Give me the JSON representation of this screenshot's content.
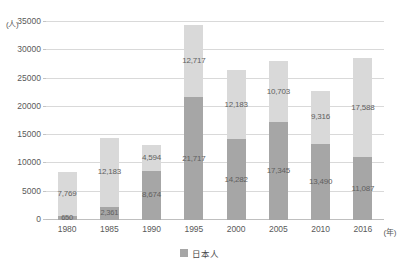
{
  "chart_data": {
    "type": "bar",
    "stacked": true,
    "title": "",
    "xlabel": "(年)",
    "ylabel": "(人)",
    "ylim": [
      0,
      35000
    ],
    "ystep": 5000,
    "grid": true,
    "legend_position": "bottom-center",
    "categories": [
      "1980",
      "1985",
      "1990",
      "1995",
      "2000",
      "2005",
      "2010",
      "2016"
    ],
    "yticks": [
      "0",
      "5000",
      "10000",
      "15000",
      "20000",
      "25000",
      "30000",
      "35000"
    ],
    "series": [
      {
        "name": "日本人",
        "color": "#a6a6a6",
        "values": [
          650,
          2361,
          8674,
          21717,
          14282,
          17345,
          13490,
          11087
        ],
        "labels": [
          "650",
          "2,361",
          "8,674",
          "21,717",
          "14,282",
          "17,345",
          "13,490",
          "11,087"
        ]
      },
      {
        "name": "",
        "color": "#d9d9d9",
        "values": [
          7769,
          12183,
          4594,
          12717,
          12183,
          10703,
          9316,
          17588
        ],
        "labels": [
          "7,769",
          "12,183",
          "4,594",
          "12,717",
          "12,183",
          "10,703",
          "9,316",
          "17,588"
        ]
      }
    ]
  },
  "legend": {
    "items": [
      {
        "label": "日本人",
        "color": "#a6a6a6"
      }
    ]
  }
}
